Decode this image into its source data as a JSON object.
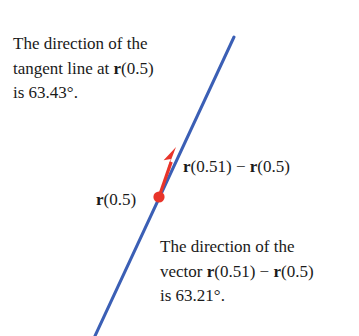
{
  "figure": {
    "width": 359,
    "height": 336,
    "background": "#ffffff"
  },
  "colors": {
    "tangent_line": "#3b5fb5",
    "vector_arrow": "#e8342a",
    "point_marker": "#e8342a",
    "text": "#1a1a1a"
  },
  "captions": {
    "tangent": {
      "line1": "The direction of the",
      "line2_prefix": "tangent line at ",
      "line2_vector": "r",
      "line2_suffix": "(0.5)",
      "line3": "is 63.43°."
    },
    "vector": {
      "line1": "The direction of the",
      "line2_prefix": "vector ",
      "line2_vector_a": "r",
      "line2_arg_a": "(0.51) ",
      "line2_minus": "−",
      "line2_vector_b": " r",
      "line2_arg_b": "(0.5)",
      "line3": "is 63.21°."
    }
  },
  "labels": {
    "secant_vector": {
      "vector_a": "r",
      "arg_a": "(0.51) ",
      "minus": "−",
      "vector_b": " r",
      "arg_b": "(0.5)"
    },
    "point": {
      "vector": "r",
      "arg": "(0.5)"
    }
  },
  "geometry": {
    "tangent_line": {
      "x1": 234,
      "y1": 37,
      "x2": 95,
      "y2": 336,
      "stroke_width": 3,
      "angle_degrees": 63.43
    },
    "vector_arrow": {
      "x1": 159,
      "y1": 197,
      "x2": 176,
      "y2": 148,
      "stroke_width": 3,
      "angle_degrees": 63.21
    },
    "point_marker": {
      "cx": 159,
      "cy": 197,
      "r": 5.5
    }
  }
}
